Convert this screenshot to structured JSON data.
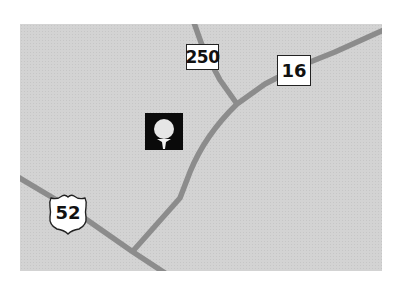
{
  "map": {
    "background_color": "#d3d3d3",
    "road_color": "#8c8c8c",
    "routes": [
      {
        "id": "250",
        "label": "250",
        "shield_type": "state-route-box"
      },
      {
        "id": "16",
        "label": "16",
        "shield_type": "state-route-box"
      },
      {
        "id": "52",
        "label": "52",
        "shield_type": "us-highway-shield"
      }
    ],
    "poi": [
      {
        "type": "golf-course",
        "icon": "golf-ball-on-tee-icon"
      }
    ]
  }
}
